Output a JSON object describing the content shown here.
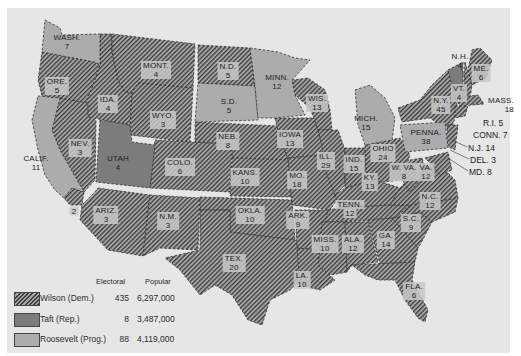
{
  "colors": {
    "background": "#e6e6e6",
    "wilson_stripe": "#3c3c3c",
    "wilson_base": "#a6a6a6",
    "taft": "#7c7c7c",
    "roosevelt": "#acacac"
  },
  "legend": {
    "header_electoral": "Electoral",
    "header_popular": "Popular",
    "rows": [
      {
        "party": "wilson",
        "label": "Wilson (Dem.)",
        "electoral": "435",
        "popular": "6,297,000"
      },
      {
        "party": "taft",
        "label": "Taft (Rep.)",
        "electoral": "8",
        "popular": "3,487,000"
      },
      {
        "party": "roosevelt",
        "label": "Roosevelt (Prog.)",
        "electoral": "88",
        "popular": "4,119,000"
      }
    ]
  },
  "states": {
    "wash": {
      "name": "WASH.",
      "ev": "7",
      "winner": "roosevelt"
    },
    "ore": {
      "name": "ORE.",
      "ev": "5",
      "winner": "wilson"
    },
    "calif": {
      "name": "CALIF.",
      "ev": "11",
      "winner": "roosevelt"
    },
    "calif_split": {
      "name": "",
      "ev": "2",
      "winner": "wilson"
    },
    "ida": {
      "name": "IDA.",
      "ev": "4",
      "winner": "wilson"
    },
    "nev": {
      "name": "NEV.",
      "ev": "3",
      "winner": "wilson"
    },
    "mont": {
      "name": "MONT.",
      "ev": "4",
      "winner": "wilson"
    },
    "wyo": {
      "name": "WYO.",
      "ev": "3",
      "winner": "wilson"
    },
    "utah": {
      "name": "UTAH",
      "ev": "4",
      "winner": "taft"
    },
    "colo": {
      "name": "COLO.",
      "ev": "6",
      "winner": "wilson"
    },
    "ariz": {
      "name": "ARIZ.",
      "ev": "3",
      "winner": "wilson"
    },
    "nm": {
      "name": "N.M.",
      "ev": "3",
      "winner": "wilson"
    },
    "nd": {
      "name": "N.D.",
      "ev": "5",
      "winner": "wilson"
    },
    "sd": {
      "name": "S.D.",
      "ev": "5",
      "winner": "roosevelt"
    },
    "neb": {
      "name": "NEB.",
      "ev": "8",
      "winner": "wilson"
    },
    "kans": {
      "name": "KANS.",
      "ev": "10",
      "winner": "wilson"
    },
    "okla": {
      "name": "OKLA.",
      "ev": "10",
      "winner": "wilson"
    },
    "tex": {
      "name": "TEX.",
      "ev": "20",
      "winner": "wilson"
    },
    "minn": {
      "name": "MINN.",
      "ev": "12",
      "winner": "roosevelt"
    },
    "iowa": {
      "name": "IOWA",
      "ev": "13",
      "winner": "wilson"
    },
    "mo": {
      "name": "MO.",
      "ev": "18",
      "winner": "wilson"
    },
    "ark": {
      "name": "ARK.",
      "ev": "9",
      "winner": "wilson"
    },
    "la": {
      "name": "LA.",
      "ev": "10",
      "winner": "wilson"
    },
    "wis": {
      "name": "WIS.",
      "ev": "13",
      "winner": "wilson"
    },
    "ill": {
      "name": "ILL.",
      "ev": "29",
      "winner": "wilson"
    },
    "mich": {
      "name": "MICH.",
      "ev": "15",
      "winner": "roosevelt"
    },
    "ind": {
      "name": "IND.",
      "ev": "15",
      "winner": "wilson"
    },
    "ohio": {
      "name": "OHIO",
      "ev": "24",
      "winner": "wilson"
    },
    "ky": {
      "name": "KY.",
      "ev": "13",
      "winner": "wilson"
    },
    "tenn": {
      "name": "TENN.",
      "ev": "12",
      "winner": "wilson"
    },
    "miss": {
      "name": "MISS.",
      "ev": "10",
      "winner": "wilson"
    },
    "ala": {
      "name": "ALA.",
      "ev": "12",
      "winner": "wilson"
    },
    "ga": {
      "name": "GA.",
      "ev": "14",
      "winner": "wilson"
    },
    "fla": {
      "name": "FLA.",
      "ev": "6",
      "winner": "wilson"
    },
    "sc": {
      "name": "S.C.",
      "ev": "9",
      "winner": "wilson"
    },
    "nc": {
      "name": "N.C.",
      "ev": "12",
      "winner": "wilson"
    },
    "va": {
      "name": "VA.",
      "ev": "12",
      "winner": "wilson"
    },
    "wva": {
      "name": "W. VA.",
      "ev": "8",
      "winner": "wilson"
    },
    "penna": {
      "name": "PENNA.",
      "ev": "38",
      "winner": "roosevelt"
    },
    "ny": {
      "name": "N.Y.",
      "ev": "45",
      "winner": "wilson"
    },
    "vt": {
      "name": "VT.",
      "ev": "4",
      "winner": "taft"
    },
    "nh": {
      "name": "N.H.",
      "ev": "4",
      "winner": "wilson"
    },
    "me": {
      "name": "ME.",
      "ev": "6",
      "winner": "wilson"
    },
    "mass": {
      "name": "MASS.",
      "ev": "18",
      "winner": "wilson"
    },
    "ri": {
      "name": "R.I.",
      "ev": "5",
      "winner": "wilson"
    },
    "conn": {
      "name": "CONN.",
      "ev": "7",
      "winner": "wilson"
    },
    "nj": {
      "name": "N.J.",
      "ev": "14",
      "winner": "wilson"
    },
    "del": {
      "name": "DEL.",
      "ev": "3",
      "winner": "wilson"
    },
    "md": {
      "name": "MD.",
      "ev": "8",
      "winner": "wilson"
    }
  },
  "callouts": {
    "nh": "N.H.",
    "nh_ev": "4",
    "mass": "MASS.",
    "mass_ev": "18",
    "ri": "R.I.  5",
    "conn": "CONN.  7",
    "nj": "N.J.  14",
    "del": "DEL.  3",
    "md": "MD.  8"
  }
}
